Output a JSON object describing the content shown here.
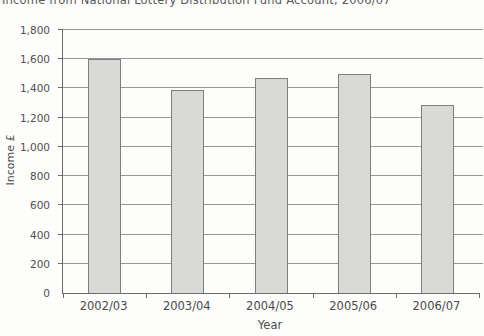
{
  "title": "Income from National Lottery Distribution Fund Account, 2006/07",
  "colors": {
    "bar_fill": "#d9d9d7",
    "bar_border": "#7e7e7e",
    "gridline": "#969696",
    "axis": "#6b6b6b",
    "text": "#4a4a4a"
  },
  "chart_data": {
    "type": "bar",
    "title": "Income from National Lottery Distribution Fund Account, 2006/07",
    "categories": [
      "2002/03",
      "2003/04",
      "2004/05",
      "2005/06",
      "2006/07"
    ],
    "values": [
      1600,
      1390,
      1470,
      1500,
      1290
    ],
    "xlabel": "Year",
    "ylabel": "Income £",
    "ylim": [
      0,
      1800
    ],
    "ytick_step": 200,
    "ytick_labels": [
      "0",
      "200",
      "400",
      "600",
      "800",
      "1,000",
      "1,200",
      "1,400",
      "1,600",
      "1,800"
    ],
    "grid": true,
    "legend": false,
    "note": "title clipped at top edge of screenshot; single grey series, no legend"
  }
}
